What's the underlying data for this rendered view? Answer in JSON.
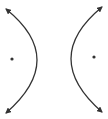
{
  "diagram": {
    "type": "hyperbola",
    "orientation": "horizontal",
    "stroke_color": "#333333",
    "point_color": "#333333",
    "branches": [
      {
        "name": "left-branch",
        "path": "M 6 9 Q 68 59 6 113"
      },
      {
        "name": "right-branch",
        "path": "M 102 7 Q 40 58 102 112"
      }
    ],
    "foci": [
      {
        "name": "left-focus",
        "cx": 12,
        "cy": 59
      },
      {
        "name": "right-focus",
        "cx": 94,
        "cy": 57
      }
    ]
  }
}
